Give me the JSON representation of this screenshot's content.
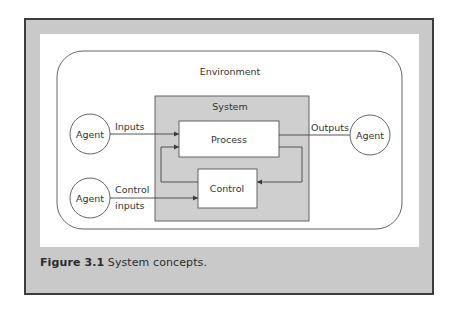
{
  "figure": {
    "caption_label": "Figure 3.1",
    "caption_text": " System concepts."
  },
  "diagram": {
    "environment_label": "Environment",
    "system_label": "System",
    "process_label": "Process",
    "control_label": "Control",
    "agents": [
      {
        "id": "agent-inputs",
        "label": "Agent"
      },
      {
        "id": "agent-outputs",
        "label": "Agent"
      },
      {
        "id": "agent-control",
        "label": "Agent"
      }
    ],
    "edges": {
      "inputs": "Inputs",
      "outputs": "Outputs",
      "control_line1": "Control",
      "control_line2": "inputs"
    }
  },
  "colors": {
    "frame_border": "#3c3c3c",
    "frame_fill": "#c9c9c9",
    "system_fill": "#cfcfcf",
    "line": "#4a4a4a"
  }
}
